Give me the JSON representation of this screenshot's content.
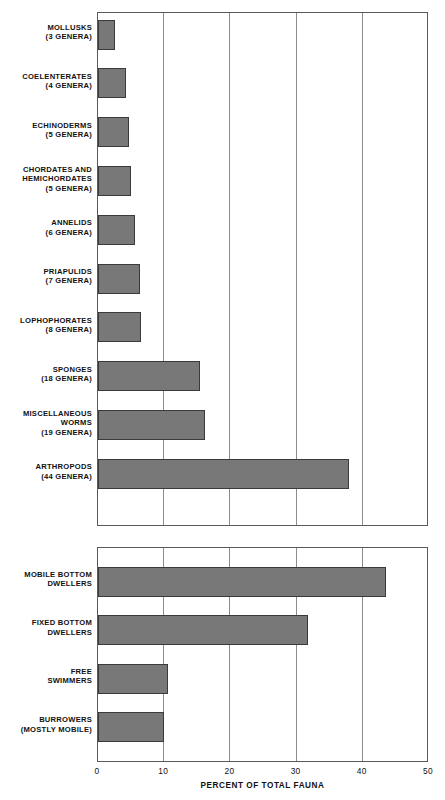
{
  "chart_data": {
    "type": "bar",
    "orientation": "horizontal",
    "title": "",
    "xlabel": "PERCENT OF TOTAL FAUNA",
    "ylabel": "",
    "xlim": [
      0,
      50
    ],
    "xticks": [
      0,
      10,
      20,
      30,
      40,
      50
    ],
    "xticklabels": [
      "0",
      "10",
      "20",
      "30",
      "40",
      "50"
    ],
    "grid": "vertical",
    "legend": "none",
    "bar_color": "#787878",
    "bar_edge_color": "#3a3a3a",
    "panels": [
      {
        "name": "taxonomic-groups",
        "categories": [
          "MOLLUSKS\n(3 GENERA)",
          "COELENTERATES\n(4 GENERA)",
          "ECHINODERMS\n(5 GENERA)",
          "CHORDATES AND\nHEMICHORDATES\n(5 GENERA)",
          "ANNELIDS\n(6 GENERA)",
          "PRIAPULIDS\n(7 GENERA)",
          "LOPHOPHORATES\n(8 GENERA)",
          "SPONGES\n(18 GENERA)",
          "MISCELLANEOUS\nWORMS\n(19 GENERA)",
          "ARTHROPODS\n(44 GENERA)"
        ],
        "values": [
          2.5,
          4.2,
          4.7,
          5.0,
          5.6,
          6.3,
          6.5,
          15.4,
          16.1,
          37.9
        ]
      },
      {
        "name": "life-habit-groups",
        "categories": [
          "MOBILE BOTTOM\nDWELLERS",
          "FIXED BOTTOM\nDWELLERS",
          "FREE\nSWIMMERS",
          "BURROWERS\n(MOSTLY MOBILE)"
        ],
        "values": [
          43.5,
          31.7,
          10.6,
          9.9
        ]
      }
    ]
  },
  "axis": {
    "title": "PERCENT OF TOTAL FAUNA",
    "ticks": [
      "0",
      "10",
      "20",
      "30",
      "40",
      "50"
    ]
  }
}
